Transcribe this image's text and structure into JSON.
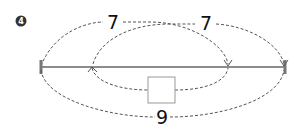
{
  "problem": {
    "number": "4"
  },
  "diagram": {
    "top_left_label": "7",
    "top_right_label": "7",
    "bottom_total_label": "9",
    "unknown_box": ""
  }
}
